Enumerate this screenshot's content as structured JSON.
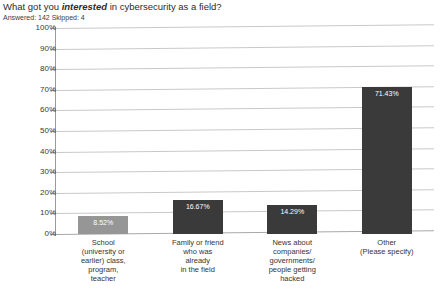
{
  "header": {
    "title_prefix": "What got you ",
    "title_emphasis": "interested",
    "title_suffix": " in cybersecurity as a field?",
    "subtitle": "Answered: 142 Skipped: 4"
  },
  "colors": {
    "bar_default": "#3a3a3a",
    "bar_highlight": "#969696",
    "gridline": "#c9c9c9",
    "axis": "#9a9a9a",
    "text": "#3a3a3a",
    "value_label": "#ffffff",
    "background": "#ffffff"
  },
  "chart_data": {
    "type": "bar",
    "title": "What got you interested in cybersecurity as a field?",
    "subtitle": "Answered: 142 Skipped: 4",
    "xlabel": "",
    "ylabel": "",
    "ylim": [
      0,
      100
    ],
    "yticks": [
      "0%",
      "10%",
      "20%",
      "30%",
      "40%",
      "50%",
      "60%",
      "70%",
      "80%",
      "90%",
      "100%"
    ],
    "ytick_values": [
      0,
      10,
      20,
      30,
      40,
      50,
      60,
      70,
      80,
      90,
      100
    ],
    "grid": true,
    "legend": "none",
    "categories": [
      {
        "lines": [
          "School",
          "(university or",
          "earlier) class,",
          "program,",
          "teacher"
        ],
        "label": "School (university or earlier) class, program, teacher"
      },
      {
        "lines": [
          "Family or friend",
          "who was",
          "already",
          "in the field"
        ],
        "label": "Family or friend who was already in the field"
      },
      {
        "lines": [
          "News about",
          "companies/",
          "governments/",
          "people getting",
          "hacked"
        ],
        "label": "News about companies/governments/people getting hacked"
      },
      {
        "lines": [
          "Other",
          "(Please specify)"
        ],
        "label": "Other (Please specify)"
      }
    ],
    "values": [
      8.52,
      16.67,
      14.29,
      71.43
    ],
    "value_labels": [
      "8.52%",
      "16.67%",
      "14.29%",
      "71.43%"
    ]
  }
}
